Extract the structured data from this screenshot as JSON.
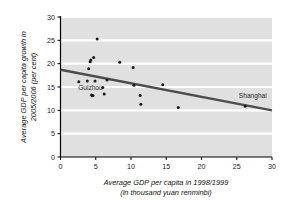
{
  "chart_data": {
    "type": "scatter",
    "title": "",
    "xlabel": "Average GDP per capita in 1998/1999 (in thousand yuan renminbi)",
    "xlabel_line1": "Average GDP per capita in 1998/1999",
    "xlabel_line2": "(in thousand yuan renminbi)",
    "ylabel": "Average GDP per capita growth in 2005/2006 (per cent)",
    "ylabel_line1": "Average GDP per capita growth in",
    "ylabel_line2": "2005/2006 (per cent)",
    "xlim": [
      0,
      30
    ],
    "ylim": [
      0,
      30
    ],
    "xticks": [
      0,
      5,
      10,
      15,
      20,
      25,
      30
    ],
    "yticks": [
      0,
      5,
      10,
      15,
      20,
      25,
      30
    ],
    "xtick_labels": [
      "0",
      "5",
      "10",
      "15",
      "20",
      "25",
      "30"
    ],
    "ytick_labels": [
      "0",
      "5",
      "10",
      "15",
      "20",
      "25",
      "30"
    ],
    "grid": "horizontal-white",
    "legend": "none",
    "plot_bgcolor": "#e0e0e0",
    "gridline_color": "#ffffff",
    "point_color": "#1a1a1a",
    "trendline_color": "#4d4d4d",
    "points": [
      {
        "x": 2.6,
        "y": 16.1
      },
      {
        "x": 3.8,
        "y": 16.3
      },
      {
        "x": 4.0,
        "y": 18.9
      },
      {
        "x": 4.2,
        "y": 20.4
      },
      {
        "x": 4.3,
        "y": 20.8
      },
      {
        "x": 4.4,
        "y": 13.3
      },
      {
        "x": 4.5,
        "y": 13.1
      },
      {
        "x": 4.6,
        "y": 13.2
      },
      {
        "x": 4.7,
        "y": 21.3
      },
      {
        "x": 4.9,
        "y": 16.3
      },
      {
        "x": 5.2,
        "y": 25.3
      },
      {
        "x": 6.0,
        "y": 14.9
      },
      {
        "x": 6.2,
        "y": 13.5
      },
      {
        "x": 6.6,
        "y": 16.5
      },
      {
        "x": 8.4,
        "y": 20.3
      },
      {
        "x": 10.3,
        "y": 19.2
      },
      {
        "x": 10.4,
        "y": 15.4
      },
      {
        "x": 11.3,
        "y": 13.2
      },
      {
        "x": 11.4,
        "y": 11.3
      },
      {
        "x": 14.5,
        "y": 15.5
      },
      {
        "x": 16.7,
        "y": 10.6
      },
      {
        "x": 26.2,
        "y": 10.9
      }
    ],
    "trendline": {
      "x0": 0,
      "y0": 18.7,
      "x1": 30,
      "y1": 10.0
    },
    "annotations": [
      {
        "label": "Guizhou",
        "x": 2.5,
        "y": 14.3
      },
      {
        "label": "Shanghai",
        "x": 25.3,
        "y": 12.6
      }
    ]
  }
}
